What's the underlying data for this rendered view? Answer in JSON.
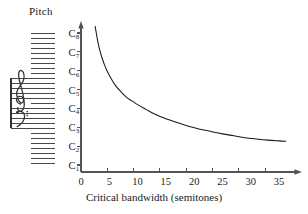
{
  "figure": {
    "pitch_label": "Pitch",
    "xaxis_title": "Critical bandwidth (semitones)",
    "staff": {
      "treble_clef": "treble-clef",
      "bass_clef": "bass-clef"
    }
  },
  "chart_data": {
    "type": "line",
    "title": "",
    "xlabel": "Critical bandwidth (semitones)",
    "ylabel": "Pitch",
    "xlim": [
      0,
      38
    ],
    "ylim": [
      1,
      8.6
    ],
    "grid": false,
    "legend": null,
    "xticks": [
      0,
      5,
      10,
      15,
      20,
      25,
      30,
      35
    ],
    "xticklabels": [
      "0",
      "5",
      "10",
      "15",
      "20",
      "25",
      "30",
      "35"
    ],
    "yticks": [
      1,
      2,
      3,
      4,
      5,
      6,
      7,
      8
    ],
    "yticklabels": [
      "C1",
      "C2",
      "C3",
      "C4",
      "C5",
      "C6",
      "C7",
      "C8"
    ],
    "series": [
      {
        "name": "critical bandwidth vs pitch",
        "x": [
          2.5,
          2.7,
          3.0,
          3.3,
          3.7,
          4.1,
          4.6,
          5.2,
          6.0,
          7.0,
          8.0,
          9.0,
          10.0,
          11.5,
          13.0,
          15.0,
          17.0,
          19.0,
          21.0,
          23.0,
          25.0,
          27.0,
          29.0,
          31.0,
          33.0,
          35.0,
          36.2
        ],
        "y": [
          8.35,
          8.0,
          7.5,
          7.1,
          6.7,
          6.35,
          6.0,
          5.65,
          5.25,
          4.9,
          4.6,
          4.4,
          4.2,
          3.95,
          3.7,
          3.45,
          3.25,
          3.05,
          2.9,
          2.78,
          2.65,
          2.55,
          2.45,
          2.38,
          2.32,
          2.28,
          2.26
        ]
      }
    ]
  }
}
